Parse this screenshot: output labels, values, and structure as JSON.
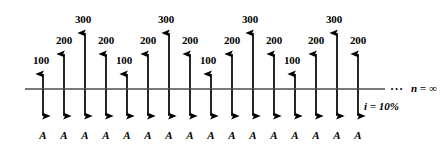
{
  "figure": {
    "interest_note": "i = 10%",
    "horizon_note": "n = ∞",
    "continuation_ellipsis": "···",
    "timeline_color": "#4d4d4d",
    "arrow_color": "#000000",
    "background_color": "#ffffff"
  },
  "chart_data": {
    "type": "bar",
    "xlabel": "",
    "ylabel": "",
    "grid": false,
    "legend": "none",
    "axis_line_y": 89,
    "categories": [
      "1",
      "2",
      "3",
      "4",
      "5",
      "6",
      "7",
      "8",
      "9",
      "10",
      "11",
      "12",
      "13",
      "14",
      "15",
      "16"
    ],
    "series": [
      {
        "name": "Receipts (upward arrows)",
        "direction": "up",
        "values": [
          100,
          200,
          300,
          200,
          100,
          200,
          300,
          200,
          100,
          200,
          300,
          200,
          100,
          200,
          300,
          200
        ],
        "labels": [
          "100",
          "200",
          "300",
          "200",
          "100",
          "200",
          "300",
          "200",
          "100",
          "200",
          "300",
          "200",
          "100",
          "200",
          "300",
          "200"
        ]
      },
      {
        "name": "Payments (downward arrows)",
        "direction": "down",
        "values": [
          "A",
          "A",
          "A",
          "A",
          "A",
          "A",
          "A",
          "A",
          "A",
          "A",
          "A",
          "A",
          "A",
          "A",
          "A",
          "A"
        ],
        "labels": [
          "A",
          "A",
          "A",
          "A",
          "A",
          "A",
          "A",
          "A",
          "A",
          "A",
          "A",
          "A",
          "A",
          "A",
          "A",
          "A"
        ]
      }
    ],
    "annotations": [
      "n = ∞",
      "i = 10%",
      "···"
    ]
  },
  "arrows": [
    {
      "x": 43,
      "value": 100,
      "label": "100",
      "label_x": 41,
      "label_y": 55,
      "tip_y": 68
    },
    {
      "x": 64,
      "value": 200,
      "label": "200",
      "label_x": 64,
      "label_y": 35,
      "tip_y": 48
    },
    {
      "x": 85,
      "value": 300,
      "label": "300",
      "label_x": 83,
      "label_y": 14,
      "tip_y": 27
    },
    {
      "x": 106,
      "value": 200,
      "label": "200",
      "label_x": 106,
      "label_y": 35,
      "tip_y": 48
    },
    {
      "x": 127,
      "value": 100,
      "label": "100",
      "label_x": 124,
      "label_y": 55,
      "tip_y": 68
    },
    {
      "x": 148,
      "value": 200,
      "label": "200",
      "label_x": 148,
      "label_y": 35,
      "tip_y": 48
    },
    {
      "x": 169,
      "value": 300,
      "label": "300",
      "label_x": 166,
      "label_y": 14,
      "tip_y": 27
    },
    {
      "x": 190,
      "value": 200,
      "label": "200",
      "label_x": 190,
      "label_y": 35,
      "tip_y": 48
    },
    {
      "x": 211,
      "value": 100,
      "label": "100",
      "label_x": 208,
      "label_y": 55,
      "tip_y": 68
    },
    {
      "x": 232,
      "value": 200,
      "label": "200",
      "label_x": 232,
      "label_y": 35,
      "tip_y": 48
    },
    {
      "x": 253,
      "value": 300,
      "label": "300",
      "label_x": 250,
      "label_y": 14,
      "tip_y": 27
    },
    {
      "x": 274,
      "value": 200,
      "label": "200",
      "label_x": 274,
      "label_y": 35,
      "tip_y": 48
    },
    {
      "x": 295,
      "value": 100,
      "label": "100",
      "label_x": 292,
      "label_y": 55,
      "tip_y": 68
    },
    {
      "x": 316,
      "value": 200,
      "label": "200",
      "label_x": 316,
      "label_y": 35,
      "tip_y": 48
    },
    {
      "x": 337,
      "value": 300,
      "label": "300",
      "label_x": 334,
      "label_y": 14,
      "tip_y": 27
    },
    {
      "x": 358,
      "value": 200,
      "label": "200",
      "label_x": 358,
      "label_y": 35,
      "tip_y": 48
    }
  ],
  "payments": [
    {
      "x": 43,
      "label": "A"
    },
    {
      "x": 64,
      "label": "A"
    },
    {
      "x": 85,
      "label": "A"
    },
    {
      "x": 106,
      "label": "A"
    },
    {
      "x": 127,
      "label": "A"
    },
    {
      "x": 148,
      "label": "A"
    },
    {
      "x": 169,
      "label": "A"
    },
    {
      "x": 190,
      "label": "A"
    },
    {
      "x": 211,
      "label": "A"
    },
    {
      "x": 232,
      "label": "A"
    },
    {
      "x": 253,
      "label": "A"
    },
    {
      "x": 274,
      "label": "A"
    },
    {
      "x": 295,
      "label": "A"
    },
    {
      "x": 316,
      "label": "A"
    },
    {
      "x": 337,
      "label": "A"
    },
    {
      "x": 358,
      "label": "A"
    }
  ]
}
